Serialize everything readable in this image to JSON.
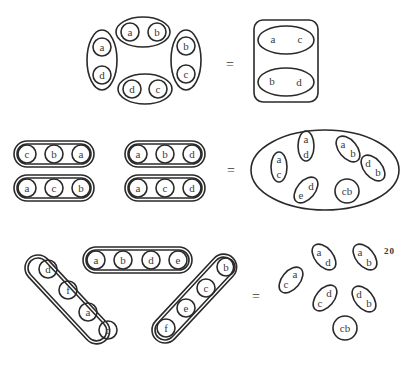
{
  "figure": {
    "page_number": "20",
    "equals_sign": "=",
    "row1": {
      "left_groups": [
        {
          "elements": [
            "a",
            "b"
          ],
          "position": "top"
        },
        {
          "elements": [
            "a",
            "d"
          ],
          "position": "left"
        },
        {
          "elements": [
            "b",
            "c"
          ],
          "position": "right"
        },
        {
          "elements": [
            "d",
            "c"
          ],
          "position": "bottom"
        }
      ],
      "right_groups": [
        {
          "elements": [
            "a",
            "c"
          ]
        },
        {
          "elements": [
            "b",
            "d"
          ]
        }
      ]
    },
    "row2": {
      "left_groups": [
        {
          "elements": [
            "c",
            "b",
            "a"
          ]
        },
        {
          "elements": [
            "a",
            "b",
            "d"
          ]
        },
        {
          "elements": [
            "a",
            "c",
            "b"
          ]
        },
        {
          "elements": [
            "a",
            "c",
            "d"
          ]
        }
      ],
      "right_pairs": [
        {
          "top": "a",
          "bottom": "c"
        },
        {
          "top": "a",
          "bottom": "d"
        },
        {
          "top": "a",
          "bottom": "b"
        },
        {
          "top": "d",
          "bottom": "b"
        },
        {
          "top": "e",
          "bottom": "d"
        },
        {
          "label": "cb"
        }
      ]
    },
    "row3": {
      "left_groups": [
        {
          "elements": [
            "d",
            "f",
            "a",
            "c"
          ]
        },
        {
          "elements": [
            "a",
            "b",
            "d",
            "e"
          ]
        },
        {
          "elements": [
            "b",
            "c",
            "e",
            "f"
          ]
        }
      ],
      "right_pairs": [
        {
          "top": "c",
          "bottom": "a"
        },
        {
          "top": "a",
          "bottom": "d"
        },
        {
          "top": "a",
          "bottom": "b"
        },
        {
          "top": "c",
          "bottom": "d"
        },
        {
          "top": "d",
          "bottom": "b"
        },
        {
          "label": "cb"
        }
      ]
    }
  }
}
